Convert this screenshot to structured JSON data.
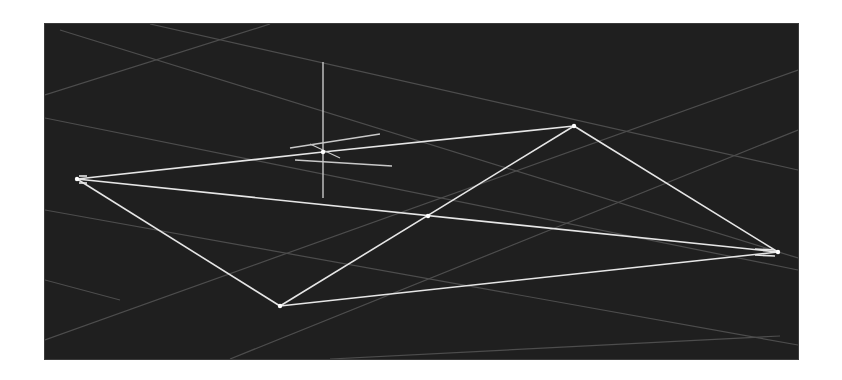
{
  "app": {
    "type": "3d-wireframe-viewport",
    "background": "#ffffff"
  },
  "viewport": {
    "x": 45,
    "y": 24,
    "width": 753,
    "height": 335,
    "background_color": "#1f1f1f"
  },
  "colors": {
    "grid": "#4d4d4d",
    "wire": "#e6e6e6",
    "gizmo": "#c8c8c8"
  },
  "grid_lines": [
    [
      45,
      95,
      270,
      24
    ],
    [
      60,
      30,
      798,
      258
    ],
    [
      45,
      118,
      798,
      270
    ],
    [
      150,
      24,
      798,
      170
    ],
    [
      45,
      340,
      798,
      70
    ],
    [
      45,
      280,
      120,
      300
    ],
    [
      230,
      359,
      798,
      130
    ],
    [
      45,
      210,
      798,
      345
    ],
    [
      330,
      359,
      780,
      336
    ]
  ],
  "vertices": {
    "left": [
      77,
      179
    ],
    "top": [
      574,
      126
    ],
    "right": [
      778,
      252
    ],
    "bottom": [
      280,
      306
    ],
    "pivot": [
      323,
      152
    ],
    "center_cross": [
      428,
      216
    ]
  },
  "edges": [
    [
      "left",
      "pivot"
    ],
    [
      "pivot",
      "top"
    ],
    [
      "left",
      "right"
    ],
    [
      "left",
      "bottom"
    ],
    [
      "bottom",
      "top"
    ],
    [
      "top",
      "right"
    ],
    [
      "bottom",
      "right"
    ]
  ],
  "edge_offsets": {
    "left_doubled": [
      [
        79,
        176
      ],
      [
        87,
        176
      ],
      [
        79,
        183
      ],
      [
        87,
        183
      ]
    ],
    "right_doubled": [
      [
        755,
        249
      ],
      [
        775,
        250
      ],
      [
        755,
        255
      ],
      [
        775,
        256
      ]
    ]
  },
  "gizmo": {
    "center": [
      323,
      152
    ],
    "vertical_axis": [
      323,
      62,
      323,
      198
    ],
    "axis_a": [
      290,
      148,
      380,
      134
    ],
    "axis_b": [
      295,
      160,
      392,
      166
    ],
    "axis_c": [
      310,
      144,
      340,
      158
    ]
  }
}
